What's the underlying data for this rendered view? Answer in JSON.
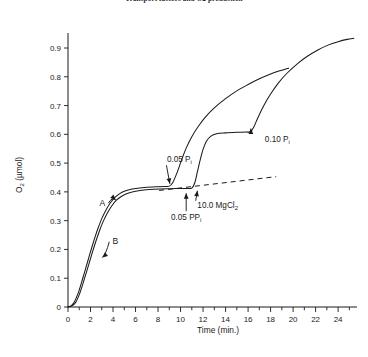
{
  "figure": {
    "title": "Transport factors and O2 production"
  },
  "chart_data": {
    "type": "line",
    "title": "Transport factors and O2 production",
    "xlabel": "Time (min.)",
    "ylabel": "O₂ (μmol)",
    "xlim": [
      0,
      25.5
    ],
    "ylim": [
      0,
      0.97
    ],
    "grid": false,
    "legend": "inline-curve-labels",
    "x_major_ticks": [
      0,
      2,
      4,
      6,
      8,
      10,
      12,
      14,
      16,
      18,
      20,
      22,
      24
    ],
    "x_major_tick_labels": [
      "0",
      "2",
      "4",
      "6",
      "8",
      "10",
      "12",
      "14",
      "16",
      "18",
      "20",
      "22",
      "24"
    ],
    "x_minor_ticks": [
      1,
      3,
      5,
      7,
      9,
      11,
      13,
      15,
      17,
      19,
      21,
      23,
      25
    ],
    "y_major_ticks": [
      0,
      0.1,
      0.2,
      0.3,
      0.4,
      0.5,
      0.6,
      0.7,
      0.8,
      0.9
    ],
    "y_major_tick_labels": [
      "0",
      "0.1",
      "0.2",
      "0.3",
      "0.4",
      "0.5",
      "0.6",
      "0.7",
      "0.8",
      "0.9"
    ],
    "series": [
      {
        "name": "A",
        "label": "A",
        "style": "solid",
        "points": [
          [
            0.0,
            0.0
          ],
          [
            0.3,
            0.005
          ],
          [
            0.6,
            0.02
          ],
          [
            0.9,
            0.048
          ],
          [
            1.2,
            0.085
          ],
          [
            1.5,
            0.125
          ],
          [
            1.8,
            0.165
          ],
          [
            2.1,
            0.205
          ],
          [
            2.4,
            0.243
          ],
          [
            2.7,
            0.277
          ],
          [
            3.0,
            0.307
          ],
          [
            3.4,
            0.339
          ],
          [
            3.8,
            0.364
          ],
          [
            4.2,
            0.382
          ],
          [
            4.6,
            0.394
          ],
          [
            5.0,
            0.402
          ],
          [
            5.6,
            0.409
          ],
          [
            6.2,
            0.413
          ],
          [
            7.0,
            0.416
          ],
          [
            8.0,
            0.418
          ],
          [
            8.6,
            0.419
          ],
          [
            9.0,
            0.42
          ],
          [
            9.3,
            0.432
          ],
          [
            9.7,
            0.468
          ],
          [
            10.1,
            0.512
          ],
          [
            10.5,
            0.552
          ],
          [
            11.0,
            0.592
          ],
          [
            11.6,
            0.629
          ],
          [
            12.3,
            0.664
          ],
          [
            13.0,
            0.692
          ],
          [
            14.0,
            0.724
          ],
          [
            15.0,
            0.751
          ],
          [
            16.0,
            0.773
          ],
          [
            17.0,
            0.793
          ],
          [
            18.0,
            0.81
          ],
          [
            19.0,
            0.823
          ],
          [
            19.6,
            0.83
          ]
        ]
      },
      {
        "name": "B",
        "label": "B",
        "style": "solid",
        "points": [
          [
            0.0,
            0.0
          ],
          [
            0.35,
            0.004
          ],
          [
            0.7,
            0.017
          ],
          [
            1.0,
            0.043
          ],
          [
            1.3,
            0.078
          ],
          [
            1.6,
            0.116
          ],
          [
            1.9,
            0.155
          ],
          [
            2.2,
            0.194
          ],
          [
            2.5,
            0.231
          ],
          [
            2.8,
            0.265
          ],
          [
            3.1,
            0.295
          ],
          [
            3.5,
            0.327
          ],
          [
            3.9,
            0.352
          ],
          [
            4.3,
            0.371
          ],
          [
            4.7,
            0.383
          ],
          [
            5.1,
            0.392
          ],
          [
            5.7,
            0.4
          ],
          [
            6.4,
            0.405
          ],
          [
            7.2,
            0.408
          ],
          [
            8.2,
            0.41
          ],
          [
            9.2,
            0.411
          ],
          [
            10.0,
            0.412
          ],
          [
            10.6,
            0.412
          ],
          [
            11.0,
            0.413
          ],
          [
            11.25,
            0.43
          ],
          [
            11.5,
            0.47
          ],
          [
            11.75,
            0.512
          ],
          [
            12.0,
            0.548
          ],
          [
            12.3,
            0.576
          ],
          [
            12.7,
            0.594
          ],
          [
            13.2,
            0.602
          ],
          [
            14.0,
            0.605
          ],
          [
            15.0,
            0.607
          ],
          [
            15.8,
            0.608
          ],
          [
            16.2,
            0.609
          ],
          [
            16.5,
            0.625
          ],
          [
            16.9,
            0.66
          ],
          [
            17.4,
            0.7
          ],
          [
            18.0,
            0.74
          ],
          [
            18.7,
            0.779
          ],
          [
            19.5,
            0.814
          ],
          [
            20.4,
            0.846
          ],
          [
            21.3,
            0.872
          ],
          [
            22.2,
            0.893
          ],
          [
            23.1,
            0.91
          ],
          [
            24.0,
            0.922
          ],
          [
            24.8,
            0.93
          ],
          [
            25.4,
            0.934
          ]
        ]
      }
    ],
    "reference_line": {
      "name": "baseline-extrapolation",
      "style": "dashed",
      "points": [
        [
          8.1,
          0.405
        ],
        [
          18.5,
          0.453
        ]
      ]
    },
    "annotations": [
      {
        "id": "pi-005",
        "text": "0.05 P",
        "subscript": "i",
        "label_x": 9.9,
        "label_y": 0.505,
        "target_x": 9.05,
        "target_y": 0.428,
        "arrow": "down-right-to-left"
      },
      {
        "id": "ppi-005",
        "text": "0.05 PP",
        "subscript": "i",
        "label_x": 10.5,
        "label_y": 0.302,
        "target_x": 10.5,
        "target_y": 0.395,
        "arrow": "up"
      },
      {
        "id": "mgcl2-100",
        "text": "10.0 MgCl",
        "subscript": "2",
        "label_x": 13.3,
        "label_y": 0.345,
        "target_x": 11.5,
        "target_y": 0.404,
        "arrow": "up-left"
      },
      {
        "id": "pi-010",
        "text": "0.10 P",
        "subscript": "i",
        "label_x": 18.6,
        "label_y": 0.572,
        "target_x": 16.25,
        "target_y": 0.62,
        "arrow": "up"
      }
    ],
    "curve_labels": [
      {
        "text": "A",
        "label_x": 3.05,
        "label_y": 0.352,
        "target_x": 4.25,
        "target_y": 0.372
      },
      {
        "text": "B",
        "label_x": 4.2,
        "label_y": 0.218,
        "target_x": 3.05,
        "target_y": 0.172
      }
    ]
  }
}
